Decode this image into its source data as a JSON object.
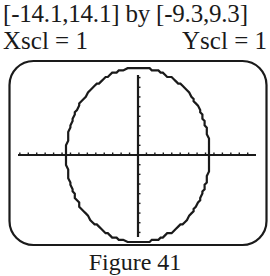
{
  "header": {
    "window_range": "[-14.1,14.1] by [-9.3,9.3]",
    "xscl": "Xscl = 1",
    "yscl": "Yscl = 1"
  },
  "caption": "Figure 41",
  "colors": {
    "ink": "#1a1a1a",
    "background": "#ffffff"
  },
  "chart_data": {
    "type": "line",
    "title": "",
    "xlabel": "",
    "ylabel": "",
    "xlim": [
      -14.1,
      14.1
    ],
    "ylim": [
      -9.3,
      9.3
    ],
    "xscl": 1,
    "yscl": 1,
    "grid": false,
    "legend": null,
    "annotations": [
      "[-14.1,14.1] by [-9.3,9.3]",
      "Xscl = 1",
      "Yscl = 1",
      "Figure 41"
    ],
    "series": [
      {
        "name": "circle",
        "shape": "circle centered at origin",
        "center": [
          0,
          0
        ],
        "radius": 9,
        "x_intercepts": [
          -9,
          9
        ],
        "y_intercepts": [
          -9,
          9
        ]
      }
    ]
  }
}
